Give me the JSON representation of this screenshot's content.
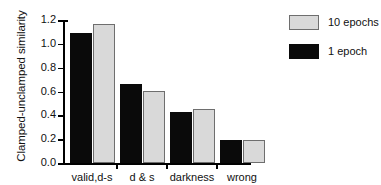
{
  "chart_data": {
    "type": "bar",
    "title": "",
    "xlabel": "",
    "ylabel": "Clamped-unclamped similarity",
    "categories": [
      "valid,d-s",
      "d & s",
      "darkness",
      "wrong"
    ],
    "series": [
      {
        "name": "1 epoch",
        "color": "#0a0a0a",
        "values": [
          1.09,
          0.66,
          0.43,
          0.195
        ]
      },
      {
        "name": "10 epochs",
        "color": "#d9d9d9",
        "values": [
          1.17,
          0.605,
          0.455,
          0.19
        ]
      }
    ],
    "legend": [
      {
        "label": "10 epochs",
        "swatch": "light"
      },
      {
        "label": "1 epoch",
        "swatch": "dark"
      }
    ],
    "legend_position": "right",
    "ylim": [
      0.0,
      1.2
    ],
    "yticks": [
      "0.0",
      "0.2",
      "0.4",
      "0.6",
      "0.8",
      "1.0",
      "1.2"
    ],
    "grid": false
  }
}
